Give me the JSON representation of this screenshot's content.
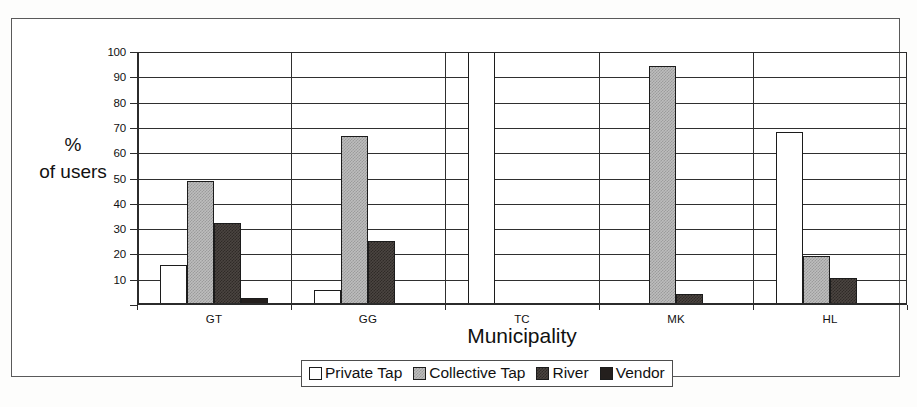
{
  "chart_data": {
    "type": "bar",
    "title": "",
    "xlabel": "Municipality",
    "ylabel": "%\nof users",
    "ylabel_lines": [
      "%",
      "of users"
    ],
    "categories": [
      "GT",
      "GG",
      "TC",
      "MK",
      "HL"
    ],
    "ylim": [
      0,
      100
    ],
    "yticks": [
      10,
      20,
      30,
      40,
      50,
      60,
      70,
      80,
      90,
      100
    ],
    "ytick_labels": [
      "10",
      "20",
      "30",
      "40",
      "50",
      "60",
      "70",
      "80",
      "90",
      "100"
    ],
    "grid": true,
    "legend_position": "bottom",
    "series": [
      {
        "name": "Private Tap",
        "color": "#ffffff",
        "values": [
          15.8,
          6.0,
          100.0,
          0,
          68.5
        ]
      },
      {
        "name": "Collective Tap",
        "color": "#bdbdbd",
        "values": [
          49.2,
          66.8,
          0,
          94.5,
          19.5
        ]
      },
      {
        "name": "River",
        "color": "#4b4541",
        "values": [
          32.3,
          25.5,
          0,
          4.5,
          10.5
        ]
      },
      {
        "name": "Vendor",
        "color": "#241f1d",
        "values": [
          2.8,
          0,
          0,
          0,
          0
        ]
      }
    ]
  },
  "legend": {
    "items": [
      {
        "label": "Private Tap",
        "swatch": "private"
      },
      {
        "label": "Collective Tap",
        "swatch": "collective"
      },
      {
        "label": "River",
        "swatch": "river"
      },
      {
        "label": "Vendor",
        "swatch": "vendor"
      }
    ]
  }
}
